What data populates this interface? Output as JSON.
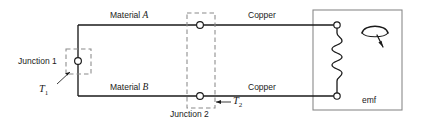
{
  "diagram": {
    "colors": {
      "wire": "#1a1a1a",
      "dashed": "#8a8a8a",
      "box": "#8a8a8a",
      "node_fill": "#ffffff",
      "text": "#1a1a1a"
    },
    "labels": {
      "material_a_prefix": "Material ",
      "material_a_symbol": "A",
      "material_b_prefix": "Material ",
      "material_b_symbol": "B",
      "copper_top": "Copper",
      "copper_bottom": "Copper",
      "junction_1": "Junction 1",
      "junction_2": "Junction 2",
      "emf": "emf"
    },
    "temperatures": {
      "t1_symbol": "T",
      "t1_subscript": "1",
      "t2_symbol": "T",
      "t2_subscript": "2"
    },
    "geometry": {
      "top_wire_y": 25,
      "bottom_wire_y": 96,
      "left_vertical_x": 78,
      "junction1_node": {
        "x": 78,
        "y": 61
      },
      "junction2_node_top": {
        "x": 200,
        "y": 25
      },
      "junction2_node_bottom": {
        "x": 200,
        "y": 96
      },
      "junction1_box": {
        "x": 66,
        "y": 49,
        "w": 25,
        "h": 25
      },
      "junction2_box": {
        "x": 187,
        "y": 13,
        "w": 28,
        "h": 95
      },
      "emf_box": {
        "x": 313,
        "y": 10,
        "w": 89,
        "h": 100
      },
      "meter_terminal_top": {
        "x": 337,
        "y": 25
      },
      "meter_terminal_bottom": {
        "x": 337,
        "y": 96
      }
    }
  }
}
